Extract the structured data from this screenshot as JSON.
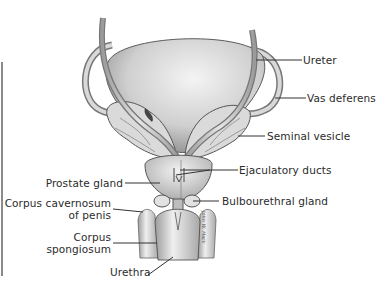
{
  "diagram": {
    "type": "anatomical-illustration",
    "colors": {
      "tissue_light": "#ececec",
      "tissue_mid": "#bdbdbd",
      "tissue_dark": "#6e6e6e",
      "outline": "#4a4a4a",
      "leader_line": "#333333",
      "label_text": "#2b2b2b",
      "frame_line": "#8a8a8a"
    },
    "labels": {
      "ureter": "Ureter",
      "vas_deferens": "Vas deferens",
      "seminal_vesicle": "Seminal vesicle",
      "ejaculatory_ducts": "Ejaculatory ducts",
      "prostate_gland": "Prostate gland",
      "bulbourethral_gland": "Bulbourethral gland",
      "corpus_cavernosum_line1": "Corpus cavernosum",
      "corpus_cavernosum_line2": "of penis",
      "corpus_spongiosum_line1": "Corpus",
      "corpus_spongiosum_line2": "spongiosum",
      "urethra": "Urethra"
    },
    "signature": "John W. Hack"
  }
}
